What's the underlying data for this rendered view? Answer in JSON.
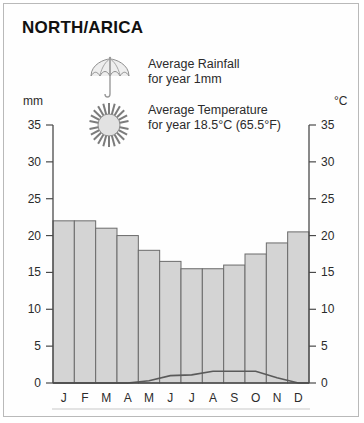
{
  "card": {
    "title": "NORTH/ARICA"
  },
  "legend": {
    "rainfall": {
      "icon": "umbrella-icon",
      "line1": "Average Rainfall",
      "line2": "for year 1mm"
    },
    "temperature": {
      "icon": "sun-icon",
      "line1": "Average Temperature",
      "line2": "for year 18.5°C (65.5°F)"
    }
  },
  "axes": {
    "left_unit": "mm",
    "right_unit": "°C"
  },
  "chart_data": {
    "type": "bar",
    "title": "NORTH/ARICA",
    "categories": [
      "J",
      "F",
      "M",
      "A",
      "M",
      "J",
      "J",
      "A",
      "S",
      "O",
      "N",
      "D"
    ],
    "xlabel": "",
    "ylabel": "mm",
    "y2label": "°C",
    "ylim": [
      0,
      35
    ],
    "y2lim": [
      0,
      35
    ],
    "yticks": [
      0,
      5,
      10,
      15,
      20,
      25,
      30,
      35
    ],
    "y2ticks": [
      0,
      5,
      10,
      15,
      20,
      25,
      30,
      35
    ],
    "grid": false,
    "legend_position": "top",
    "series": [
      {
        "name": "Average Temperature",
        "type": "bar",
        "axis": "right",
        "unit": "°C",
        "values": [
          22.0,
          22.0,
          21.0,
          20.0,
          18.0,
          16.5,
          15.5,
          15.5,
          16.0,
          17.5,
          19.0,
          20.5
        ]
      },
      {
        "name": "Average Rainfall",
        "type": "line",
        "axis": "left",
        "unit": "mm",
        "values": [
          0.0,
          0.0,
          0.0,
          0.0,
          0.3,
          1.0,
          1.1,
          1.6,
          1.6,
          1.6,
          0.7,
          0.0
        ]
      }
    ],
    "annotations": {
      "year_rainfall": "1mm",
      "year_temperature_c": "18.5°C",
      "year_temperature_f": "65.5°F"
    }
  },
  "colors": {
    "bar_fill": "#d4d4d4",
    "bar_stroke": "#6b6b6b",
    "line_stroke": "#5a5a5a",
    "axis": "#4a4a4a",
    "text": "#2b2b2b",
    "border": "#b9b9b9",
    "background": "#fefefe"
  }
}
